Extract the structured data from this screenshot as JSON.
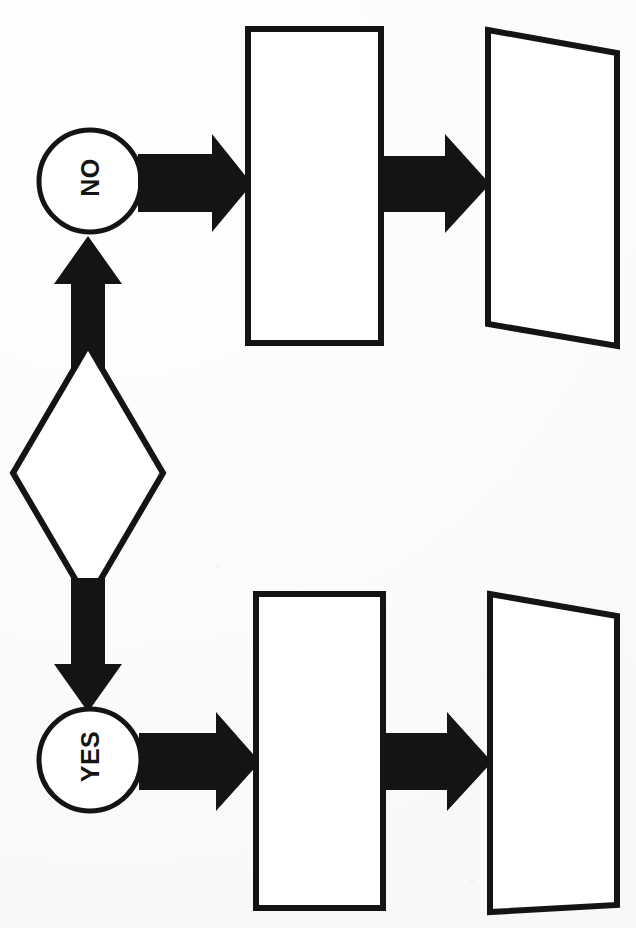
{
  "document": {
    "kind": "scanned-flowchart",
    "orientation": "rotated-90",
    "page_width": 636,
    "page_height": 928,
    "background_color": "#fdfdfd",
    "ink_color": "#141414",
    "top_cut_text": ""
  },
  "diagram": {
    "title": "",
    "stroke_color": "#141414",
    "fill_color": "#ffffff",
    "arrow_color": "#141414",
    "nodes": [
      {
        "id": "decision",
        "shape": "diamond",
        "label": "",
        "cx": 88,
        "cy": 473,
        "rx": 75,
        "ry": 128
      },
      {
        "id": "branch-no",
        "shape": "circle",
        "label": "NO",
        "label_rotation": -90,
        "cx": 90,
        "cy": 181,
        "r": 51
      },
      {
        "id": "branch-yes",
        "shape": "circle",
        "label": "YES",
        "label_rotation": -90,
        "cx": 90,
        "cy": 760,
        "r": 51
      },
      {
        "id": "process-top",
        "shape": "rectangle",
        "label": "",
        "x": 248,
        "y": 29,
        "width": 133,
        "height": 314
      },
      {
        "id": "process-bottom",
        "shape": "rectangle",
        "label": "",
        "x": 256,
        "y": 594,
        "width": 127,
        "height": 314
      },
      {
        "id": "output-top",
        "shape": "parallelogram",
        "label": "",
        "x": 487,
        "y": 28,
        "width": 130,
        "height": 318
      },
      {
        "id": "output-bottom",
        "shape": "parallelogram",
        "label": "",
        "x": 489,
        "y": 592,
        "width": 128,
        "height": 320
      }
    ],
    "connectors": [
      {
        "id": "decision-to-no",
        "from": "decision",
        "to": "branch-no",
        "direction": "up",
        "style": "block-arrow"
      },
      {
        "id": "decision-to-yes",
        "from": "decision",
        "to": "branch-yes",
        "direction": "down",
        "style": "block-arrow"
      },
      {
        "id": "no-to-process-top",
        "from": "branch-no",
        "to": "process-top",
        "direction": "right",
        "style": "block-arrow"
      },
      {
        "id": "process-top-to-output-top",
        "from": "process-top",
        "to": "output-top",
        "direction": "right",
        "style": "block-arrow"
      },
      {
        "id": "yes-to-process-bottom",
        "from": "branch-yes",
        "to": "process-bottom",
        "direction": "right",
        "style": "block-arrow"
      },
      {
        "id": "process-bottom-to-output-bottom",
        "from": "process-bottom",
        "to": "output-bottom",
        "direction": "right",
        "style": "block-arrow"
      }
    ]
  }
}
